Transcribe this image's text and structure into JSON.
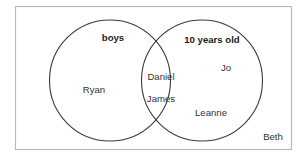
{
  "diagram": {
    "type": "venn",
    "title": "",
    "universe": {
      "label": "",
      "outside_members": [
        "Beth"
      ]
    },
    "sets": [
      {
        "id": "boys",
        "label": "boys",
        "label_bold": true,
        "only_members": [
          "Ryan"
        ]
      },
      {
        "id": "ten-years-old",
        "label": "10 years old",
        "label_bold": true,
        "only_members": [
          "Jo",
          "Leanne"
        ]
      }
    ],
    "intersection": {
      "members": [
        "Daniel",
        "James"
      ]
    },
    "colors": {
      "circle_stroke": "#3a3a3a",
      "rect_stroke": "#b9b9b9",
      "text": "#333333",
      "label_text": "#1a1a1a",
      "background": "#ffffff"
    },
    "labels": {
      "left_set": "boys",
      "right_set": "10 years old",
      "left_only_1": "Ryan",
      "intersection_1": "Daniel",
      "intersection_2": "James",
      "right_only_1": "Jo",
      "right_only_2": "Leanne",
      "outside_1": "Beth"
    }
  }
}
